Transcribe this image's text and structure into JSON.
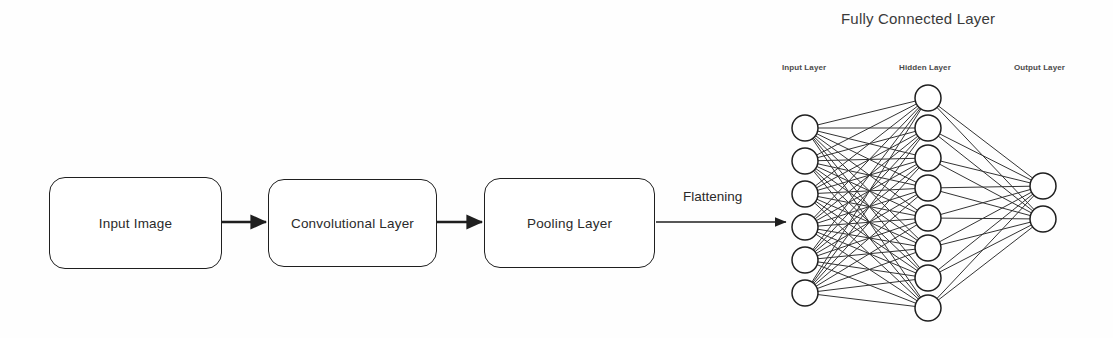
{
  "canvas": {
    "width": 1113,
    "height": 338,
    "background": "#fefefe",
    "stroke_color": "#1f1f1f",
    "text_color": "#2a2a2a"
  },
  "pipeline": {
    "boxes": [
      {
        "id": "input-image",
        "label": "Input Image",
        "x": 49,
        "y": 177,
        "w": 173,
        "h": 92
      },
      {
        "id": "convolutional-layer",
        "label": "Convolutional Layer",
        "x": 268,
        "y": 179,
        "w": 169,
        "h": 88
      },
      {
        "id": "pooling-layer",
        "label": "Pooling Layer",
        "x": 484,
        "y": 178,
        "w": 171,
        "h": 90
      }
    ],
    "arrows": [
      {
        "id": "arrow-input-to-conv",
        "x1": 222,
        "y1": 222,
        "x2": 266,
        "y2": 222,
        "thick": true
      },
      {
        "id": "arrow-conv-to-pool",
        "x1": 437,
        "y1": 222,
        "x2": 482,
        "y2": 222,
        "thick": true
      },
      {
        "id": "arrow-pool-to-fc",
        "x1": 656,
        "y1": 222,
        "x2": 786,
        "y2": 222,
        "thick": false
      }
    ],
    "flattening_label": {
      "text": "Flattening",
      "x": 683,
      "y": 189
    }
  },
  "fully_connected": {
    "title": {
      "text": "Fully Connected Layer",
      "x": 841,
      "y": 10
    },
    "captions": [
      {
        "id": "input-layer-caption",
        "text": "Input Layer",
        "x": 782,
        "y": 63
      },
      {
        "id": "hidden-layer-caption",
        "text": "Hidden Layer",
        "x": 899,
        "y": 63
      },
      {
        "id": "output-layer-caption",
        "text": "Output Layer",
        "x": 1014,
        "y": 63
      }
    ],
    "node_radius": 13,
    "layers": [
      {
        "id": "input-layer",
        "name": "Input Layer",
        "count": 6,
        "cx": 805,
        "cy_start": 128,
        "cy_step": 33
      },
      {
        "id": "hidden-layer",
        "name": "Hidden Layer",
        "count": 8,
        "cx": 928,
        "cy_start": 98,
        "cy_step": 30
      },
      {
        "id": "output-layer",
        "name": "Output Layer",
        "count": 2,
        "cx": 1043,
        "cy_start": 186,
        "cy_step": 33
      }
    ]
  },
  "chart_data": {
    "type": "diagram",
    "stages": [
      "Input Image",
      "Convolutional Layer",
      "Pooling Layer",
      "Fully Connected Layer"
    ],
    "transitions": [
      "",
      "",
      "Flattening"
    ],
    "network_layers": [
      {
        "name": "Input Layer",
        "nodes": 6
      },
      {
        "name": "Hidden Layer",
        "nodes": 8
      },
      {
        "name": "Output Layer",
        "nodes": 2
      }
    ],
    "edges": [
      {
        "from": "Input Layer",
        "to": "Hidden Layer",
        "type": "fully-connected",
        "count": 48
      },
      {
        "from": "Hidden Layer",
        "to": "Output Layer",
        "type": "fully-connected",
        "count": 16
      }
    ]
  }
}
